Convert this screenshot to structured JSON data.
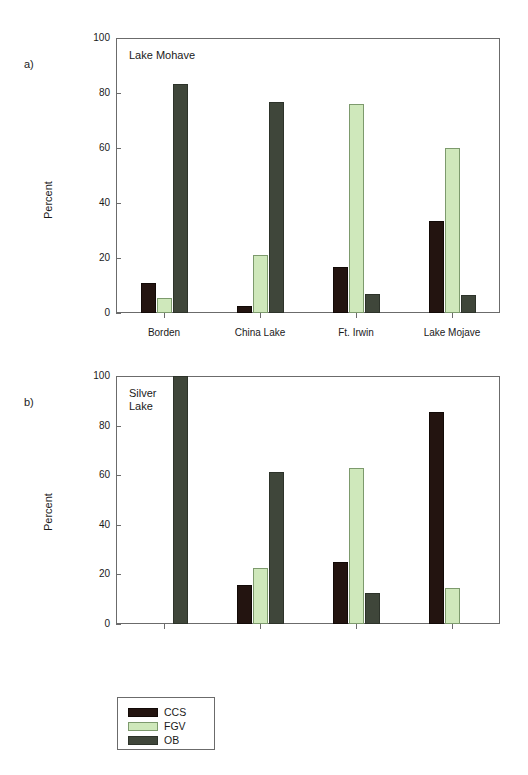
{
  "figure": {
    "panel_a_label": "a)",
    "panel_b_label": "b)",
    "caption": ""
  },
  "legend": {
    "position": "below-plots-left",
    "entries": [
      {
        "key": "CCS",
        "label": "CCS",
        "color": "#231410"
      },
      {
        "key": "FGV",
        "label": "FGV",
        "color": "#cfe8bb"
      },
      {
        "key": "OB",
        "label": "OB",
        "color": "#3f463a"
      }
    ]
  },
  "chart_data": [
    {
      "type": "bar",
      "panel": "a",
      "title": "Lake Mohave",
      "xlabel": "",
      "ylabel": "Percent",
      "ylim": [
        0,
        100
      ],
      "yticks": [
        0,
        20,
        40,
        60,
        80,
        100
      ],
      "ytick_labels": [
        "0",
        "20",
        "40",
        "60",
        "80",
        "100"
      ],
      "grid": false,
      "legend_position": "below",
      "categories": [
        "Borden",
        "China Lake",
        "Ft. Irwin",
        "Lake Mojave"
      ],
      "series": [
        {
          "name": "CCS",
          "color": "#231410",
          "values": [
            11.0,
            2.5,
            16.8,
            33.3
          ]
        },
        {
          "name": "FGV",
          "color": "#cfe8bb",
          "values": [
            5.6,
            21.0,
            75.9,
            60.1
          ]
        },
        {
          "name": "OB",
          "color": "#3f463a",
          "values": [
            83.3,
            76.8,
            7.0,
            6.6
          ]
        }
      ]
    },
    {
      "type": "bar",
      "panel": "b",
      "title": "Silver\nLake",
      "xlabel": "",
      "ylabel": "Percent",
      "ylim": [
        0,
        100
      ],
      "yticks": [
        0,
        20,
        40,
        60,
        80,
        100
      ],
      "ytick_labels": [
        "0",
        "20",
        "40",
        "60",
        "80",
        "100"
      ],
      "grid": false,
      "legend_position": "below",
      "categories": [
        "Borden",
        "China Lake",
        "Ft. Irwin",
        "Lake Mojave"
      ],
      "series": [
        {
          "name": "CCS",
          "color": "#231410",
          "values": [
            0.0,
            15.8,
            24.8,
            85.5
          ]
        },
        {
          "name": "FGV",
          "color": "#cfe8bb",
          "values": [
            0.0,
            22.6,
            62.8,
            14.4
          ]
        },
        {
          "name": "OB",
          "color": "#3f463a",
          "values": [
            100.0,
            61.3,
            12.6,
            0.0
          ]
        }
      ]
    }
  ]
}
